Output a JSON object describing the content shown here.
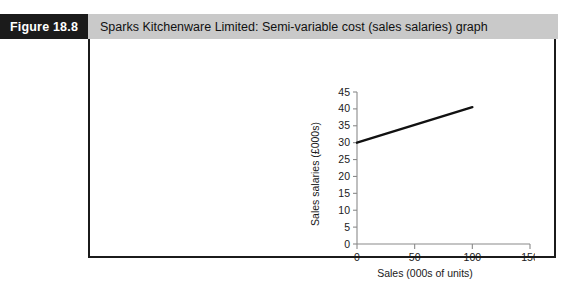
{
  "figure": {
    "label": "Figure 18.8",
    "title": "Sparks Kitchenware Limited: Semi-variable cost (sales salaries) graph",
    "label_bg": "#1b1b1b",
    "title_bg": "#c9c9c9",
    "border_color": "#1b1b1b"
  },
  "chart_data": {
    "type": "line",
    "title": "",
    "xlabel": "Sales (000s of units)",
    "ylabel": "Sales salaries (£000s)",
    "xlim": [
      0,
      150
    ],
    "ylim": [
      0,
      45
    ],
    "xticks": [
      0,
      50,
      100,
      150
    ],
    "xtick_labels": [
      "0",
      "50",
      "100",
      "150"
    ],
    "yticks": [
      0,
      5,
      10,
      15,
      20,
      25,
      30,
      35,
      40,
      45
    ],
    "ytick_labels": [
      "0",
      "5",
      "10",
      "15",
      "20",
      "25",
      "30",
      "35",
      "40",
      "45"
    ],
    "grid": false,
    "legend": "none",
    "line_color": "#111111",
    "series": [
      {
        "name": "Sales salaries",
        "x": [
          0,
          100
        ],
        "values": [
          30,
          40.5
        ]
      }
    ]
  }
}
